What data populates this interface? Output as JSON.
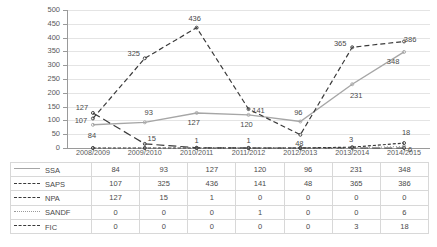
{
  "chart_data": {
    "type": "line",
    "title": "",
    "xlabel": "",
    "ylabel": "",
    "ylim": [
      0,
      500
    ],
    "ytick_step": 50,
    "grid": true,
    "legend_position": "table-below",
    "categories": [
      "2008/2009",
      "2009/2010",
      "2010/2011",
      "2011/2012",
      "2012/2013",
      "2013/2014",
      "2014/2015"
    ],
    "yticks": [
      "500",
      "450",
      "400",
      "350",
      "300",
      "250",
      "200",
      "150",
      "100",
      "50",
      "0"
    ],
    "series": [
      {
        "name": "SSA",
        "style": "solid",
        "color": "#a6a6a6",
        "values": [
          84,
          93,
          127,
          120,
          96,
          231,
          348
        ]
      },
      {
        "name": "SAPS",
        "style": "dash-dash",
        "color": "#3a3a3a",
        "values": [
          107,
          325,
          436,
          141,
          48,
          365,
          386
        ]
      },
      {
        "name": "NPA",
        "style": "long-dash",
        "color": "#3a3a3a",
        "values": [
          127,
          15,
          1,
          0,
          0,
          0,
          0
        ]
      },
      {
        "name": "SANDF",
        "style": "dotted",
        "color": "#9a9a9a",
        "values": [
          0,
          0,
          0,
          1,
          0,
          0,
          6
        ]
      },
      {
        "name": "FIC",
        "style": "short-dash",
        "color": "#3a3a3a",
        "values": [
          0,
          0,
          0,
          0,
          0,
          3,
          18
        ]
      }
    ],
    "point_labels": [
      {
        "text": "84",
        "series": "SSA",
        "category": "2008/2009"
      },
      {
        "text": "93",
        "series": "SSA",
        "category": "2009/2010"
      },
      {
        "text": "127",
        "series": "SSA",
        "category": "2010/2011"
      },
      {
        "text": "120",
        "series": "SSA",
        "category": "2011/2012"
      },
      {
        "text": "96",
        "series": "SSA",
        "category": "2012/2013"
      },
      {
        "text": "231",
        "series": "SSA",
        "category": "2013/2014"
      },
      {
        "text": "348",
        "series": "SSA",
        "category": "2014/2015"
      },
      {
        "text": "107",
        "series": "SAPS",
        "category": "2008/2009"
      },
      {
        "text": "325",
        "series": "SAPS",
        "category": "2009/2010"
      },
      {
        "text": "436",
        "series": "SAPS",
        "category": "2010/2011"
      },
      {
        "text": "141",
        "series": "SAPS",
        "category": "2011/2012"
      },
      {
        "text": "48",
        "series": "SAPS",
        "category": "2012/2013"
      },
      {
        "text": "365",
        "series": "SAPS",
        "category": "2013/2014"
      },
      {
        "text": "386",
        "series": "SAPS",
        "category": "2014/2015"
      },
      {
        "text": "127",
        "series": "NPA",
        "category": "2008/2009"
      },
      {
        "text": "15",
        "series": "NPA",
        "category": "2009/2010"
      },
      {
        "text": "1",
        "series": "NPA",
        "category": "2010/2011"
      },
      {
        "text": "1",
        "series": "SANDF",
        "category": "2011/2012"
      },
      {
        "text": "6",
        "series": "SANDF",
        "category": "2014/2015"
      },
      {
        "text": "3",
        "series": "FIC",
        "category": "2013/2014"
      },
      {
        "text": "18",
        "series": "FIC",
        "category": "2014/2015"
      }
    ]
  },
  "table": {
    "row_labels": [
      "SSA",
      "SAPS",
      "NPA",
      "SANDF",
      "FIC"
    ],
    "rows": [
      [
        "84",
        "93",
        "127",
        "120",
        "96",
        "231",
        "348"
      ],
      [
        "107",
        "325",
        "436",
        "141",
        "48",
        "365",
        "386"
      ],
      [
        "127",
        "15",
        "1",
        "0",
        "0",
        "0",
        "0"
      ],
      [
        "0",
        "0",
        "0",
        "1",
        "0",
        "0",
        "6"
      ],
      [
        "0",
        "0",
        "0",
        "0",
        "0",
        "3",
        "18"
      ]
    ]
  }
}
